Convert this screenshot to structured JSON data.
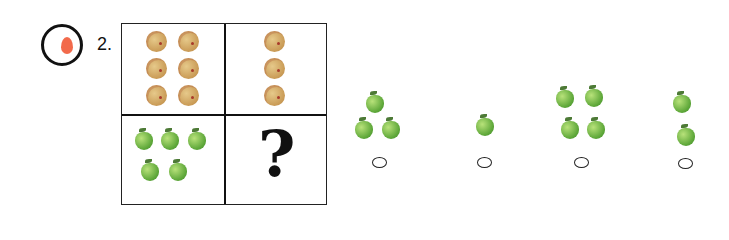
{
  "question": {
    "number_label": "2.",
    "marker_icon": "balloon-icon",
    "marker_color": "#f26a4b"
  },
  "grid": {
    "top_left": {
      "item": "cookie",
      "count": 6
    },
    "top_right": {
      "item": "cookie",
      "count": 3
    },
    "bottom_left": {
      "item": "apple",
      "count": 5
    },
    "bottom_right": {
      "symbol": "?"
    }
  },
  "options": [
    {
      "item": "apple",
      "count": 3
    },
    {
      "item": "apple",
      "count": 1
    },
    {
      "item": "apple",
      "count": 4
    },
    {
      "item": "apple",
      "count": 2
    }
  ]
}
